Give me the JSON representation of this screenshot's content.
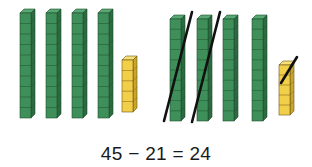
{
  "equation": "45 − 21 = 24",
  "colors": {
    "tens_face": "#3f8f5a",
    "tens_side": "#2c6a41",
    "tens_top": "#57a873",
    "tens_line": "#1f4d2e",
    "ones_face": "#f2cf48",
    "ones_side": "#c9a52e",
    "ones_top": "#f7df7a",
    "ones_line": "#6b5414",
    "slash": "#111111"
  },
  "groups": [
    {
      "name": "minuend-45",
      "tens": 4,
      "ones": 5,
      "crossed_tens": 0,
      "crossed_ones": 0
    },
    {
      "name": "regrouped-45-minus-21",
      "tens": 4,
      "ones": 5,
      "crossed_tens": 2,
      "crossed_ones": 1
    }
  ]
}
